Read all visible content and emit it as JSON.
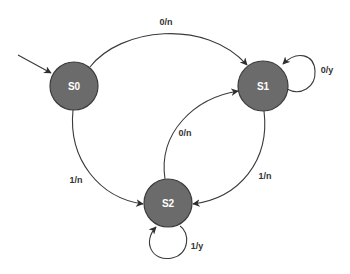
{
  "diagram": {
    "type": "state-machine",
    "colors": {
      "node_fill": "#6b6b6b",
      "node_stroke": "#3c3c3c",
      "node_text": "#ffffff",
      "edge": "#3a3a3a",
      "edge_text": "#333333",
      "background": "#ffffff"
    },
    "initial_state": "S0",
    "nodes": [
      {
        "id": "S0",
        "label": "S0"
      },
      {
        "id": "S1",
        "label": "S1"
      },
      {
        "id": "S2",
        "label": "S2"
      }
    ],
    "edges": [
      {
        "from": "S0",
        "to": "S1",
        "label": "0/n"
      },
      {
        "from": "S1",
        "to": "S1",
        "label": "0/y"
      },
      {
        "from": "S0",
        "to": "S2",
        "label": "1/n"
      },
      {
        "from": "S2",
        "to": "S1",
        "label": "0/n"
      },
      {
        "from": "S1",
        "to": "S2",
        "label": "1/n"
      },
      {
        "from": "S2",
        "to": "S2",
        "label": "1/y"
      }
    ]
  }
}
